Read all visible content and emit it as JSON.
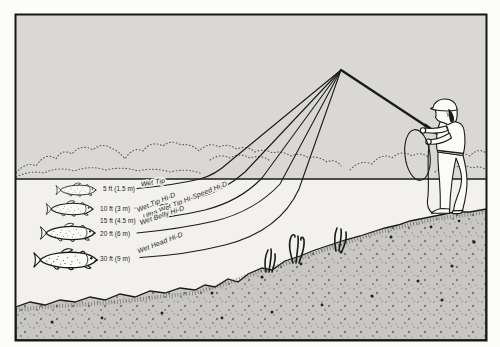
{
  "diagram": {
    "sink_lines": [
      {
        "name": "Wet Tip",
        "depth_label": "5 ft (1.5 m)"
      },
      {
        "name": "Wet Tip Hi-D",
        "depth_label": "10 ft (3 m)"
      },
      {
        "name": "Ultra Wet Tip Hi-Speed Hi-D",
        "depth_label": "15 ft (4.5 m)"
      },
      {
        "name": "Wet Belly Hi-D",
        "depth_label": "20 ft (6 m)"
      },
      {
        "name": "Wet Head Hi-D",
        "depth_label": "30 ft (9 m)"
      }
    ],
    "scene": {
      "fish_count": 4,
      "plant_count": 3,
      "angler": "fly-angler-standing-on-bank"
    },
    "colors": {
      "page": "#fcfcfb",
      "sky": "#d9d8d5",
      "water": "#f2f1ee",
      "bank": "#c8c7c3",
      "ink": "#1a1a1a",
      "frame": "#161616",
      "stipple": "#5c5c59"
    }
  }
}
